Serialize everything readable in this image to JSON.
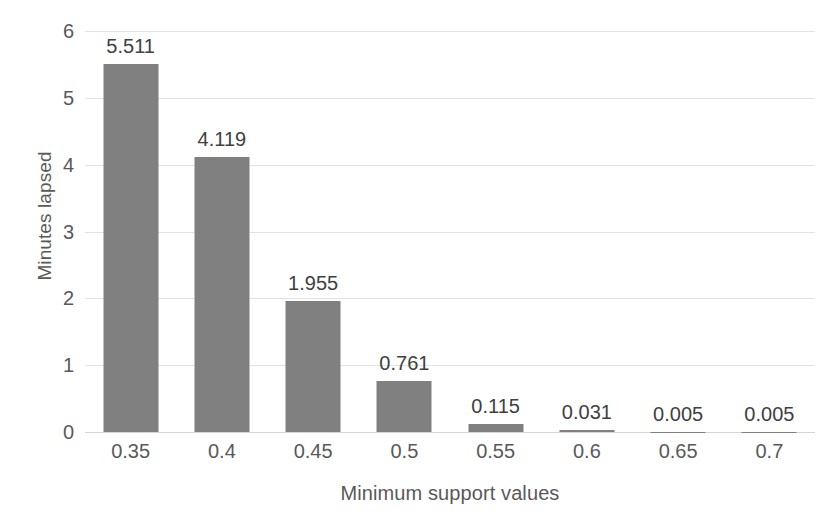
{
  "chart_data": {
    "type": "bar",
    "title": "",
    "subtitle": "",
    "xlabel": "Minimum support values",
    "ylabel": "Minutes lapsed",
    "categories": [
      "0.35",
      "0.4",
      "0.45",
      "0.5",
      "0.55",
      "0.6",
      "0.65",
      "0.7"
    ],
    "values": [
      5.511,
      4.119,
      1.955,
      0.761,
      0.115,
      0.031,
      0.005,
      0.005
    ],
    "data_labels": [
      "5.511",
      "4.119",
      "1.955",
      "0.761",
      "0.115",
      "0.031",
      "0.005",
      "0.005"
    ],
    "ylim": [
      0,
      6
    ],
    "y_ticks": [
      "0",
      "1",
      "2",
      "3",
      "4",
      "5",
      "6"
    ],
    "y_tick_values": [
      0,
      1,
      2,
      3,
      4,
      5,
      6
    ],
    "grid": true,
    "grid_axis": "y",
    "legend": false,
    "legend_position": "none",
    "series": [
      {
        "name": "Minutes lapsed",
        "values": [
          5.511,
          4.119,
          1.955,
          0.761,
          0.115,
          0.031,
          0.005,
          0.005
        ]
      }
    ]
  },
  "colors": {
    "bar": "#808080",
    "gridline": "#e2e2e2",
    "baseline": "#d4d4d4",
    "axis_text": "#595959",
    "label_text": "#404040",
    "background": "#ffffff"
  }
}
